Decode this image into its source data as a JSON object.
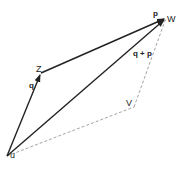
{
  "diagram": {
    "type": "vector-addition-parallelogram",
    "points": {
      "U": {
        "label": "u",
        "x": 7,
        "y": 156
      },
      "Z": {
        "label": "Z",
        "x": 41,
        "y": 73
      },
      "W": {
        "label": "W",
        "x": 166,
        "y": 18
      },
      "V": {
        "label": "V",
        "x": 134,
        "y": 107
      }
    },
    "vectors": [
      {
        "from": "U",
        "to": "Z",
        "label": "q",
        "style": "solid"
      },
      {
        "from": "Z",
        "to": "W",
        "label": "p",
        "style": "solid"
      },
      {
        "from": "U",
        "to": "W",
        "label": "q + p",
        "style": "solid"
      },
      {
        "from": "U",
        "to": "V",
        "label": "",
        "style": "dashed"
      },
      {
        "from": "V",
        "to": "W",
        "label": "",
        "style": "dashed"
      }
    ],
    "labels": {
      "p": "p",
      "q": "q",
      "sum": "q + p",
      "Z": "Z",
      "W": "W",
      "V": "V",
      "U": "u"
    },
    "colors": {
      "solid": "#222222",
      "dashed": "#999999"
    }
  }
}
